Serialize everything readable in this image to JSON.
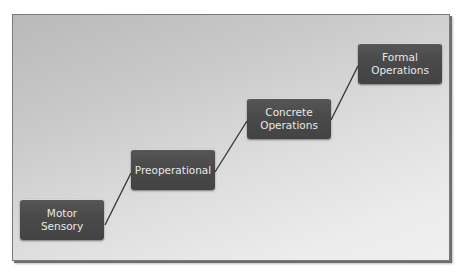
{
  "diagram": {
    "type": "staircase-process",
    "colors": {
      "box_fill": "#4a4a4a",
      "box_text": "#e8e8e8",
      "connector": "#3a3a3a",
      "background_start": "#b9b9b9",
      "background_end": "#efefef"
    },
    "stages": [
      {
        "label_line1": "Motor",
        "label_line2": "Sensory"
      },
      {
        "label_line1": "Preoperational",
        "label_line2": ""
      },
      {
        "label_line1": "Concrete",
        "label_line2": "Operations"
      },
      {
        "label_line1": "Formal",
        "label_line2": "Operations"
      }
    ],
    "connections": [
      {
        "from": "Motor Sensory",
        "to": "Preoperational"
      },
      {
        "from": "Preoperational",
        "to": "Concrete Operations"
      },
      {
        "from": "Concrete Operations",
        "to": "Formal Operations"
      }
    ]
  }
}
